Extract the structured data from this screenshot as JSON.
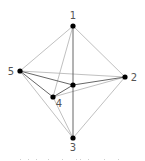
{
  "diagram": {
    "type": "graph",
    "colors": {
      "background": "#ffffff",
      "node": "#000000",
      "edge_dark": "#555555",
      "edge_light": "#b0b0b0",
      "label": "#555555"
    },
    "nodes": [
      {
        "id": "1",
        "label": "1",
        "x": 73,
        "y": 26,
        "label_dx": 0,
        "label_dy": -7
      },
      {
        "id": "2",
        "label": "2",
        "x": 125,
        "y": 77,
        "label_dx": 9,
        "label_dy": 4
      },
      {
        "id": "3",
        "label": "3",
        "x": 73,
        "y": 138,
        "label_dx": 0,
        "label_dy": 13
      },
      {
        "id": "4",
        "label": "4",
        "x": 53,
        "y": 97,
        "label_dx": 6,
        "label_dy": 10
      },
      {
        "id": "5",
        "label": "5",
        "x": 20,
        "y": 71,
        "label_dx": -9,
        "label_dy": 4
      },
      {
        "id": "c",
        "label": "",
        "x": 73,
        "y": 85,
        "label_dx": 0,
        "label_dy": 0
      }
    ],
    "edges": [
      {
        "from": "1",
        "to": "3",
        "style": "dark"
      },
      {
        "from": "5",
        "to": "c",
        "style": "dark"
      },
      {
        "from": "c",
        "to": "2",
        "style": "dark"
      },
      {
        "from": "4",
        "to": "c",
        "style": "dark"
      },
      {
        "from": "5",
        "to": "4",
        "style": "dark"
      },
      {
        "from": "1",
        "to": "5",
        "style": "light"
      },
      {
        "from": "1",
        "to": "2",
        "style": "light"
      },
      {
        "from": "1",
        "to": "4",
        "style": "light"
      },
      {
        "from": "5",
        "to": "2",
        "style": "light"
      },
      {
        "from": "4",
        "to": "2",
        "style": "light"
      },
      {
        "from": "5",
        "to": "3",
        "style": "light"
      },
      {
        "from": "4",
        "to": "3",
        "style": "light"
      },
      {
        "from": "2",
        "to": "3",
        "style": "light"
      }
    ]
  }
}
